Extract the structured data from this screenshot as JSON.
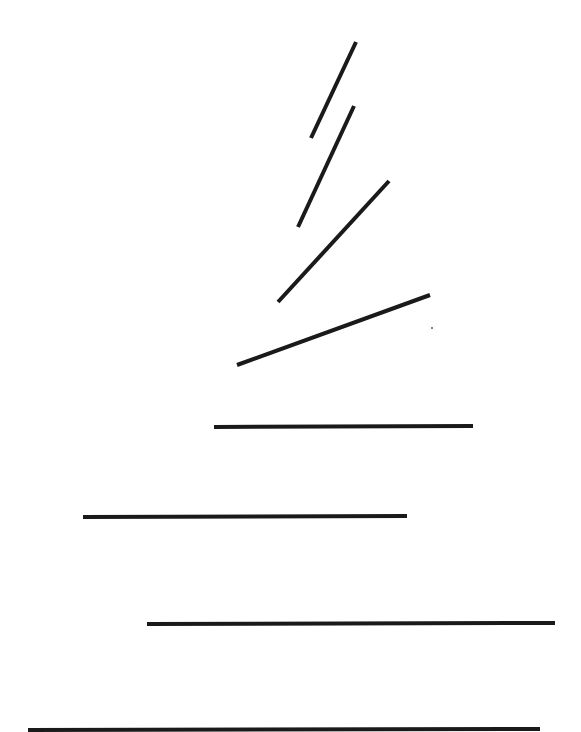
{
  "canvas": {
    "width": 581,
    "height": 732,
    "background": "#ffffff"
  },
  "stroke": {
    "color": "#1a1a1a",
    "width": 4
  },
  "segments": [
    {
      "id": "segment-1",
      "x1": 311,
      "y1": 138,
      "x2": 356,
      "y2": 42
    },
    {
      "id": "segment-2",
      "x1": 298,
      "y1": 227,
      "x2": 354,
      "y2": 106
    },
    {
      "id": "segment-3",
      "x1": 278,
      "y1": 302,
      "x2": 389,
      "y2": 181
    },
    {
      "id": "segment-4",
      "x1": 237,
      "y1": 365,
      "x2": 430,
      "y2": 295
    },
    {
      "id": "segment-5",
      "x1": 214,
      "y1": 427,
      "x2": 473,
      "y2": 426
    },
    {
      "id": "segment-6",
      "x1": 83,
      "y1": 517,
      "x2": 407,
      "y2": 516
    },
    {
      "id": "segment-7",
      "x1": 147,
      "y1": 624,
      "x2": 555,
      "y2": 623
    },
    {
      "id": "segment-8",
      "x1": 28,
      "y1": 730,
      "x2": 540,
      "y2": 729
    }
  ],
  "dots": [
    {
      "id": "stray-dot",
      "cx": 432,
      "cy": 328,
      "r": 1
    }
  ]
}
